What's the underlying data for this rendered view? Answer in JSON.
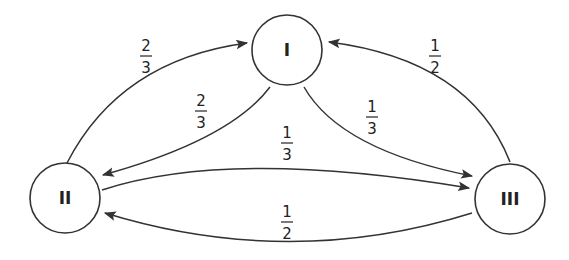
{
  "diagram": {
    "title": "",
    "nodes": [
      {
        "id": "I",
        "label": "I",
        "cx": 287,
        "cy": 50,
        "r": 35
      },
      {
        "id": "II",
        "label": "II",
        "cx": 65,
        "cy": 198,
        "r": 35
      },
      {
        "id": "III",
        "label": "III",
        "cx": 510,
        "cy": 199,
        "r": 35
      }
    ],
    "edges": [
      {
        "from": "II",
        "to": "I",
        "numerator": "2",
        "denominator": "3",
        "label_x": 146,
        "label_y": 55
      },
      {
        "from": "I",
        "to": "II",
        "numerator": "2",
        "denominator": "3",
        "label_x": 201,
        "label_y": 110
      },
      {
        "from": "I",
        "to": "III",
        "numerator": "1",
        "denominator": "3",
        "label_x": 372,
        "label_y": 108
      },
      {
        "from": "II",
        "to": "III",
        "numerator": "1",
        "denominator": "3",
        "label_x": 287,
        "label_y": 137
      },
      {
        "from": "III",
        "to": "I",
        "numerator": "1",
        "denominator": "2",
        "label_x": 435,
        "label_y": 55
      },
      {
        "from": "III",
        "to": "II",
        "numerator": "1",
        "denominator": "2",
        "label_x": 287,
        "label_y": 210
      }
    ],
    "stroke_color": "#333333"
  }
}
